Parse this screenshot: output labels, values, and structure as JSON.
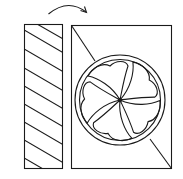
{
  "diagram": {
    "title": "",
    "colors": {
      "stroke": "#1a1a1a",
      "background": "#ffffff"
    },
    "elements": [
      {
        "id": "rotation-arrow",
        "type": "curved-arrow"
      },
      {
        "id": "hatched-panel",
        "type": "rectangle",
        "fill": "diagonal-hatch"
      },
      {
        "id": "fan-housing",
        "type": "rectangle",
        "with": "diagonal-line"
      },
      {
        "id": "fan-ring",
        "type": "circle"
      },
      {
        "id": "fan-blades",
        "type": "pinwheel",
        "count": 5
      }
    ]
  }
}
